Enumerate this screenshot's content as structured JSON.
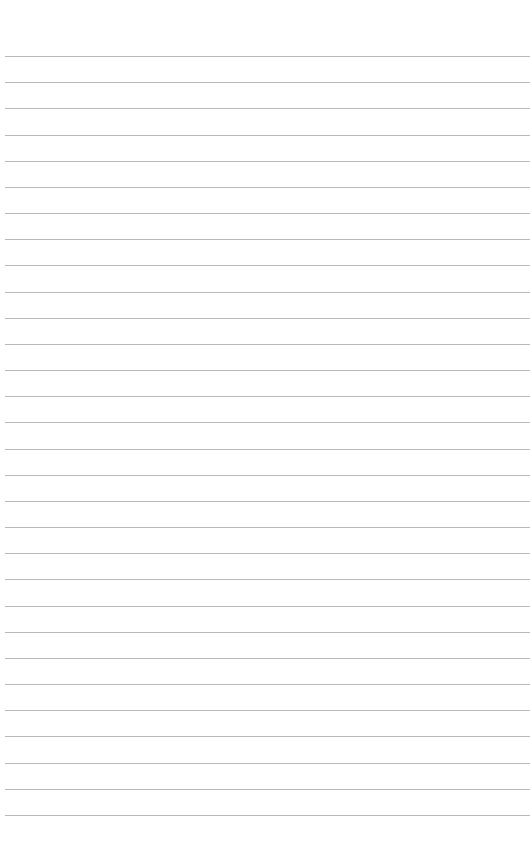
{
  "page": {
    "type": "lined-paper",
    "background_color": "#ffffff",
    "line_color": "#b9b9b9",
    "line_count": 30,
    "first_line_y": 56,
    "line_spacing": 26.17,
    "line_left_x": 5
  }
}
